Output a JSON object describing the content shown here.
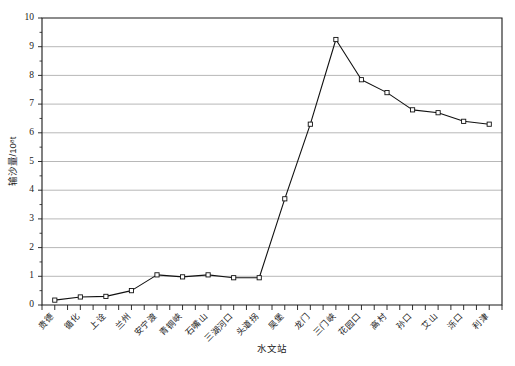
{
  "chart_data": {
    "type": "line",
    "title": "",
    "xlabel": "水文站",
    "ylabel": "输沙量/10⁸t",
    "ylim": [
      0,
      10
    ],
    "ytick_step": 1,
    "grid": true,
    "legend": "none",
    "marker": "open-square",
    "categories": [
      "贵德",
      "循化",
      "上诠",
      "兰州",
      "安宁渡",
      "青铜峡",
      "石嘴山",
      "三湖河口",
      "头道拐",
      "吴堡",
      "龙门",
      "三门峡",
      "花园口",
      "高村",
      "孙口",
      "艾山",
      "泺口",
      "利津"
    ],
    "yticks": [
      "0",
      "1",
      "2",
      "3",
      "4",
      "5",
      "6",
      "7",
      "8",
      "9",
      "10"
    ],
    "series": [
      {
        "name": "输沙量",
        "values": [
          0.17,
          0.28,
          0.3,
          0.5,
          1.05,
          0.98,
          1.05,
          0.95,
          0.95,
          3.7,
          6.3,
          9.25,
          7.85,
          7.4,
          6.8,
          6.7,
          6.4,
          6.3
        ]
      }
    ]
  },
  "geometry": {
    "plot_left": 42,
    "plot_right": 502,
    "plot_top": 18,
    "plot_bottom": 305
  }
}
